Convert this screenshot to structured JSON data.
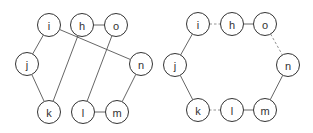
{
  "graphs": [
    {
      "id": "left-graph",
      "nodes": [
        "i",
        "h",
        "o",
        "j",
        "n",
        "k",
        "l",
        "m"
      ],
      "edges": [
        {
          "from": "i",
          "to": "j",
          "style": "solid"
        },
        {
          "from": "i",
          "to": "n",
          "style": "solid"
        },
        {
          "from": "h",
          "to": "o",
          "style": "solid"
        },
        {
          "from": "h",
          "to": "k",
          "style": "solid"
        },
        {
          "from": "o",
          "to": "l",
          "style": "solid"
        },
        {
          "from": "j",
          "to": "k",
          "style": "solid"
        },
        {
          "from": "l",
          "to": "m",
          "style": "solid"
        },
        {
          "from": "m",
          "to": "n",
          "style": "solid"
        }
      ]
    },
    {
      "id": "right-graph",
      "nodes": [
        "i",
        "h",
        "o",
        "j",
        "n",
        "k",
        "l",
        "m"
      ],
      "edges": [
        {
          "from": "i",
          "to": "j",
          "style": "solid"
        },
        {
          "from": "i",
          "to": "h",
          "style": "dashed"
        },
        {
          "from": "h",
          "to": "o",
          "style": "solid"
        },
        {
          "from": "o",
          "to": "n",
          "style": "dashed"
        },
        {
          "from": "n",
          "to": "m",
          "style": "solid"
        },
        {
          "from": "m",
          "to": "l",
          "style": "solid"
        },
        {
          "from": "l",
          "to": "k",
          "style": "dashed"
        },
        {
          "from": "k",
          "to": "j",
          "style": "solid"
        }
      ]
    }
  ]
}
